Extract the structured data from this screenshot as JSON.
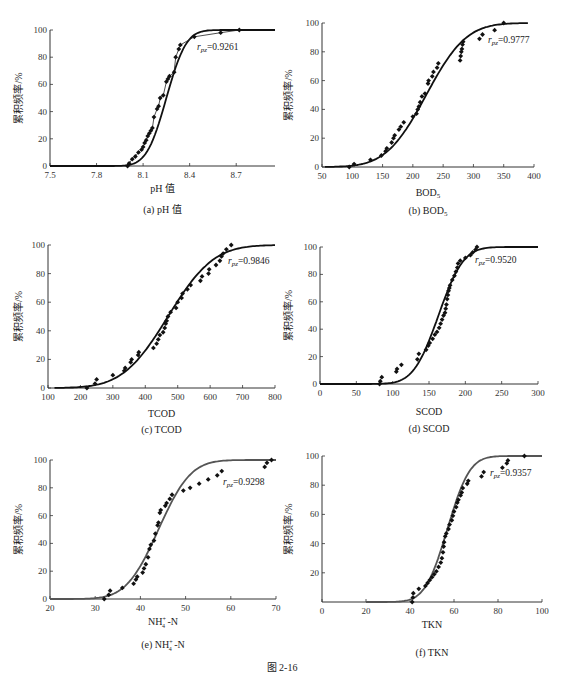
{
  "figure_caption": "图 2-16",
  "chart_data": [
    {
      "id": "a",
      "type": "line+scatter",
      "caption": "(a) pH 值",
      "xlabel": "pH 值",
      "ylabel": "累积频率/%",
      "annotation": "r_pz=0.9261",
      "annotation_r": "r",
      "annotation_sub": "pz",
      "annotation_val": "=0.9261",
      "xlim": [
        7.5,
        8.95
      ],
      "ylim": [
        0,
        100
      ],
      "xticks": [
        7.5,
        7.8,
        8.1,
        8.4,
        8.7
      ],
      "xtick_labels": [
        "7.5",
        "7.8",
        "8.1",
        "8.4",
        "8.7"
      ],
      "yticks": [
        0,
        20,
        40,
        60,
        80,
        100
      ],
      "grid": false,
      "curve_color": "#111111",
      "fit_curve": {
        "mu": 8.25,
        "sigma": 0.1,
        "x_start": 7.5,
        "x_end": 8.95
      },
      "empirical_line": true,
      "points": [
        [
          8.0,
          0
        ],
        [
          8.01,
          2
        ],
        [
          8.03,
          5
        ],
        [
          8.05,
          7
        ],
        [
          8.07,
          10
        ],
        [
          8.09,
          12
        ],
        [
          8.1,
          14
        ],
        [
          8.11,
          17
        ],
        [
          8.12,
          19
        ],
        [
          8.13,
          22
        ],
        [
          8.14,
          24
        ],
        [
          8.15,
          26
        ],
        [
          8.16,
          28
        ],
        [
          8.17,
          36
        ],
        [
          8.19,
          42
        ],
        [
          8.2,
          44
        ],
        [
          8.21,
          50
        ],
        [
          8.23,
          52
        ],
        [
          8.25,
          62
        ],
        [
          8.26,
          64
        ],
        [
          8.27,
          66
        ],
        [
          8.3,
          69
        ],
        [
          8.31,
          80
        ],
        [
          8.33,
          86
        ],
        [
          8.34,
          89
        ],
        [
          8.43,
          95
        ],
        [
          8.6,
          98
        ],
        [
          8.72,
          100
        ]
      ]
    },
    {
      "id": "b",
      "type": "line+scatter",
      "caption": "(b) BOD5",
      "xlabel": "BOD5",
      "ylabel": "累积频率/%",
      "annotation": "r_pz=0.9777",
      "annotation_r": "r",
      "annotation_sub": "pz",
      "annotation_val": "=0.9777",
      "xlim": [
        50,
        400
      ],
      "ylim": [
        0,
        100
      ],
      "xticks": [
        50,
        100,
        150,
        200,
        250,
        300,
        350,
        400
      ],
      "xtick_labels": [
        "50",
        "100",
        "150",
        "200",
        "250",
        "300",
        "350",
        "400"
      ],
      "yticks": [
        0,
        20,
        40,
        60,
        80,
        100
      ],
      "grid": false,
      "curve_color": "#111111",
      "fit_curve": {
        "mu": 222,
        "sigma": 52,
        "x_start": 55,
        "x_end": 390
      },
      "empirical_line": false,
      "points": [
        [
          95,
          0
        ],
        [
          103,
          2
        ],
        [
          130,
          5
        ],
        [
          148,
          8
        ],
        [
          155,
          11
        ],
        [
          157,
          13
        ],
        [
          165,
          17
        ],
        [
          168,
          20
        ],
        [
          170,
          22
        ],
        [
          177,
          26
        ],
        [
          180,
          28
        ],
        [
          185,
          31
        ],
        [
          200,
          35
        ],
        [
          206,
          37
        ],
        [
          208,
          40
        ],
        [
          210,
          42
        ],
        [
          212,
          45
        ],
        [
          215,
          49
        ],
        [
          220,
          51
        ],
        [
          225,
          58
        ],
        [
          226,
          60
        ],
        [
          232,
          63
        ],
        [
          234,
          66
        ],
        [
          240,
          69
        ],
        [
          242,
          72
        ],
        [
          278,
          74
        ],
        [
          279,
          77
        ],
        [
          280,
          80
        ],
        [
          281,
          82
        ],
        [
          282,
          85
        ],
        [
          283,
          87
        ],
        [
          310,
          89
        ],
        [
          315,
          92
        ],
        [
          335,
          95
        ],
        [
          350,
          100
        ]
      ]
    },
    {
      "id": "c",
      "type": "line+scatter",
      "caption": "(c) TCOD",
      "xlabel": "TCOD",
      "ylabel": "累积频率/%",
      "annotation": "r_pz=0.9846",
      "annotation_r": "r",
      "annotation_sub": "pz",
      "annotation_val": "=0.9846",
      "xlim": [
        100,
        800
      ],
      "ylim": [
        0,
        100
      ],
      "xticks": [
        100,
        200,
        300,
        400,
        500,
        600,
        700,
        800
      ],
      "xtick_labels": [
        "100",
        "200",
        "300",
        "400",
        "500",
        "600",
        "700",
        "800"
      ],
      "yticks": [
        0,
        20,
        40,
        60,
        80,
        100
      ],
      "grid": false,
      "curve_color": "#111111",
      "fit_curve": {
        "mu": 470,
        "sigma": 110,
        "x_start": 120,
        "x_end": 800
      },
      "empirical_line": false,
      "points": [
        [
          220,
          0
        ],
        [
          245,
          3
        ],
        [
          250,
          6
        ],
        [
          300,
          9
        ],
        [
          335,
          12
        ],
        [
          338,
          14
        ],
        [
          355,
          18
        ],
        [
          358,
          20
        ],
        [
          378,
          23
        ],
        [
          380,
          25
        ],
        [
          425,
          28
        ],
        [
          435,
          31
        ],
        [
          440,
          34
        ],
        [
          445,
          37
        ],
        [
          455,
          39
        ],
        [
          460,
          42
        ],
        [
          463,
          45
        ],
        [
          466,
          47
        ],
        [
          470,
          50
        ],
        [
          478,
          53
        ],
        [
          495,
          56
        ],
        [
          500,
          60
        ],
        [
          512,
          63
        ],
        [
          515,
          66
        ],
        [
          530,
          69
        ],
        [
          540,
          72
        ],
        [
          570,
          75
        ],
        [
          575,
          78
        ],
        [
          595,
          80
        ],
        [
          597,
          83
        ],
        [
          618,
          86
        ],
        [
          630,
          89
        ],
        [
          635,
          92
        ],
        [
          640,
          94
        ],
        [
          650,
          97
        ],
        [
          665,
          100
        ]
      ]
    },
    {
      "id": "d",
      "type": "line+scatter",
      "caption": "(d) SCOD",
      "xlabel": "SCOD",
      "ylabel": "累积频率/%",
      "annotation": "r_pz=0.9520",
      "annotation_r": "r",
      "annotation_sub": "pz",
      "annotation_val": "=0.9520",
      "xlim": [
        0,
        300
      ],
      "ylim": [
        0,
        100
      ],
      "xticks": [
        0,
        50,
        100,
        150,
        200,
        250,
        300
      ],
      "xtick_labels": [
        "0",
        "50",
        "100",
        "150",
        "200",
        "250",
        "300"
      ],
      "yticks": [
        0,
        20,
        40,
        60,
        80,
        100
      ],
      "grid": false,
      "curve_color": "#111111",
      "fit_curve": {
        "mu": 163,
        "sigma": 27,
        "x_start": 0,
        "x_end": 300
      },
      "empirical_line": false,
      "points": [
        [
          82,
          0
        ],
        [
          83,
          2
        ],
        [
          85,
          5
        ],
        [
          105,
          9
        ],
        [
          106,
          11
        ],
        [
          112,
          14
        ],
        [
          134,
          18
        ],
        [
          136,
          22
        ],
        [
          146,
          25
        ],
        [
          149,
          28
        ],
        [
          151,
          30
        ],
        [
          155,
          33
        ],
        [
          158,
          36
        ],
        [
          161,
          38
        ],
        [
          164,
          41
        ],
        [
          166,
          44
        ],
        [
          168,
          47
        ],
        [
          170,
          50
        ],
        [
          172,
          52
        ],
        [
          173,
          55
        ],
        [
          174,
          58
        ],
        [
          175,
          62
        ],
        [
          176,
          65
        ],
        [
          177,
          68
        ],
        [
          178,
          70
        ],
        [
          179,
          72
        ],
        [
          182,
          76
        ],
        [
          185,
          79
        ],
        [
          187,
          82
        ],
        [
          189,
          85
        ],
        [
          190,
          88
        ],
        [
          193,
          90
        ],
        [
          200,
          92
        ],
        [
          207,
          94
        ],
        [
          210,
          96
        ],
        [
          214,
          98
        ],
        [
          216,
          100
        ]
      ]
    },
    {
      "id": "e",
      "type": "line+scatter",
      "caption": "(e) NH4+ -N",
      "xlabel": "NH4+ -N",
      "ylabel": "累积频率/%",
      "annotation": "r_pz=0.9298",
      "annotation_r": "r",
      "annotation_sub": "pz",
      "annotation_val": "=0.9298",
      "xlim": [
        20,
        70
      ],
      "ylim": [
        0,
        100
      ],
      "xticks": [
        20,
        30,
        40,
        50,
        60,
        70
      ],
      "xtick_labels": [
        "20",
        "30",
        "40",
        "50",
        "60",
        "70"
      ],
      "yticks": [
        0,
        20,
        40,
        60,
        80,
        100
      ],
      "grid": false,
      "curve_color": "#555555",
      "fit_curve": {
        "mu": 44,
        "sigma": 5.6,
        "x_start": 20,
        "x_end": 70
      },
      "empirical_line": false,
      "points": [
        [
          32,
          0
        ],
        [
          33,
          3
        ],
        [
          33.3,
          6
        ],
        [
          36,
          8
        ],
        [
          38.5,
          11
        ],
        [
          39,
          14
        ],
        [
          39.3,
          16
        ],
        [
          40.5,
          19
        ],
        [
          40.8,
          22
        ],
        [
          41.2,
          25
        ],
        [
          41.7,
          30
        ],
        [
          42,
          36
        ],
        [
          42.3,
          39
        ],
        [
          43,
          42
        ],
        [
          43.3,
          47
        ],
        [
          43.8,
          53
        ],
        [
          44,
          55
        ],
        [
          44.3,
          62
        ],
        [
          44.5,
          64
        ],
        [
          45.5,
          67
        ],
        [
          45.8,
          69
        ],
        [
          46.5,
          72
        ],
        [
          47,
          75
        ],
        [
          49.5,
          78
        ],
        [
          51,
          80
        ],
        [
          53,
          83
        ],
        [
          55,
          86
        ],
        [
          57,
          89
        ],
        [
          58,
          92
        ],
        [
          67.5,
          95
        ],
        [
          68,
          98
        ],
        [
          69,
          100
        ]
      ]
    },
    {
      "id": "f",
      "type": "line+scatter",
      "caption": "(f) TKN",
      "xlabel": "TKN",
      "ylabel": "累积频率/%",
      "annotation": "r_pz=0.9357",
      "annotation_r": "r",
      "annotation_sub": "pz",
      "annotation_val": "=0.9357",
      "xlim": [
        0,
        100
      ],
      "ylim": [
        0,
        100
      ],
      "xticks": [
        0,
        20,
        40,
        60,
        80,
        100
      ],
      "xtick_labels": [
        "0",
        "20",
        "40",
        "60",
        "80",
        "100"
      ],
      "yticks": [
        20,
        40,
        60,
        80,
        100
      ],
      "grid": false,
      "curve_color": "#555555",
      "fit_curve": {
        "mu": 57,
        "sigma": 8,
        "x_start": 20,
        "x_end": 100
      },
      "empirical_line": false,
      "points": [
        [
          41,
          0
        ],
        [
          41.3,
          3
        ],
        [
          41.5,
          6
        ],
        [
          44,
          9
        ],
        [
          47,
          11
        ],
        [
          48,
          13
        ],
        [
          49,
          15
        ],
        [
          50,
          17
        ],
        [
          51,
          19
        ],
        [
          52,
          21
        ],
        [
          53,
          24
        ],
        [
          54,
          27
        ],
        [
          54.5,
          30
        ],
        [
          55,
          34
        ],
        [
          55.3,
          38
        ],
        [
          55.5,
          41
        ],
        [
          56,
          45
        ],
        [
          56.5,
          47
        ],
        [
          57.5,
          50
        ],
        [
          58,
          53
        ],
        [
          59,
          56
        ],
        [
          59.5,
          59
        ],
        [
          60,
          62
        ],
        [
          61,
          65
        ],
        [
          61.5,
          68
        ],
        [
          62,
          70
        ],
        [
          63,
          73
        ],
        [
          63.5,
          75
        ],
        [
          64,
          78
        ],
        [
          66,
          81
        ],
        [
          66.5,
          83
        ],
        [
          72.5,
          86
        ],
        [
          73.5,
          89
        ],
        [
          82,
          92
        ],
        [
          84,
          95
        ],
        [
          84.5,
          97
        ],
        [
          92,
          100
        ]
      ]
    }
  ],
  "layout": {
    "panels": [
      {
        "id": "a",
        "axis_x": 50,
        "axis_right": 275,
        "y_top": 30,
        "y_bottom": 166,
        "xlabel_y": 192,
        "caption_y": 213,
        "ylabel_x": 22,
        "annot_x": 197,
        "annot_y": 50
      },
      {
        "id": "b",
        "axis_x": 322,
        "axis_right": 534,
        "y_top": 23,
        "y_bottom": 167,
        "xlabel_y": 196,
        "caption_y": 214,
        "ylabel_x": 292,
        "annot_x": 488,
        "annot_y": 43
      },
      {
        "id": "c",
        "axis_x": 48,
        "axis_right": 275,
        "y_top": 245,
        "y_bottom": 388,
        "xlabel_y": 417,
        "caption_y": 433,
        "ylabel_x": 22,
        "annot_x": 228,
        "annot_y": 264
      },
      {
        "id": "d",
        "axis_x": 320,
        "axis_right": 538,
        "y_top": 247,
        "y_bottom": 384,
        "xlabel_y": 415,
        "caption_y": 432,
        "ylabel_x": 292,
        "annot_x": 475,
        "annot_y": 263
      },
      {
        "id": "e",
        "axis_x": 50,
        "axis_right": 276,
        "y_top": 460,
        "y_bottom": 599,
        "xlabel_y": 625,
        "caption_y": 648,
        "ylabel_x": 22,
        "annot_x": 223,
        "annot_y": 485
      },
      {
        "id": "f",
        "axis_x": 322,
        "axis_right": 542,
        "y_top": 456,
        "y_bottom": 602,
        "xlabel_y": 628,
        "caption_y": 656,
        "ylabel_x": 292,
        "annot_x": 490,
        "annot_y": 476
      }
    ],
    "figcap_x": 282,
    "figcap_y": 671
  }
}
